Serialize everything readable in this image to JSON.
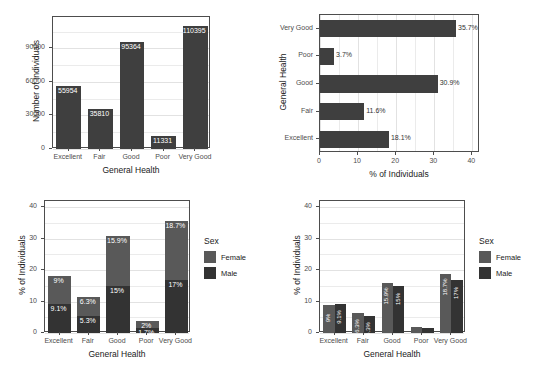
{
  "chart_data": [
    {
      "panel": "top-left",
      "type": "bar",
      "title": "",
      "xlabel": "General Health",
      "ylabel": "Number of Individuals",
      "categories": [
        "Excellent",
        "Fair",
        "Good",
        "Poor",
        "Very Good"
      ],
      "values": [
        55954,
        35810,
        95364,
        11331,
        110395
      ],
      "data_labels": [
        "55954",
        "35810",
        "95364",
        "11331",
        "110395"
      ],
      "yticks": [
        0,
        30000,
        60000,
        90000
      ],
      "ytick_labels": [
        "0",
        "30000",
        "60000",
        "90000"
      ],
      "ylim": [
        0,
        118000
      ],
      "grid": true,
      "legend": "none",
      "bar_color": "#3f3f3f"
    },
    {
      "panel": "top-right",
      "type": "bar",
      "orientation": "horizontal",
      "title": "",
      "xlabel": "% of Individuals",
      "ylabel": "General Health",
      "categories": [
        "Very Good",
        "Poor",
        "Good",
        "Fair",
        "Excellent"
      ],
      "values": [
        35.7,
        3.7,
        30.9,
        11.6,
        18.1
      ],
      "data_labels": [
        "35.7%",
        "3.7%",
        "30.9%",
        "11.6%",
        "18.1%"
      ],
      "xticks": [
        0,
        10,
        20,
        30,
        40
      ],
      "xtick_labels": [
        "0",
        "10",
        "20",
        "30",
        "40"
      ],
      "xlim": [
        0,
        42
      ],
      "grid": true,
      "legend": "none",
      "bar_color": "#3f3f3f"
    },
    {
      "panel": "bottom-left",
      "type": "bar",
      "stacked": true,
      "title": "",
      "xlabel": "General Health",
      "ylabel": "% of Individuals",
      "categories": [
        "Excellent",
        "Fair",
        "Good",
        "Poor",
        "Very Good"
      ],
      "series": [
        {
          "name": "Female",
          "color": "#595959",
          "values": [
            9.0,
            6.3,
            15.9,
            2.0,
            18.7
          ],
          "data_labels": [
            "9%",
            "6.3%",
            "15.9%",
            "2%",
            "18.7%"
          ]
        },
        {
          "name": "Male",
          "color": "#333333",
          "values": [
            9.1,
            5.3,
            15.0,
            1.7,
            17.0
          ],
          "data_labels": [
            "9.1%",
            "5.3%",
            "15%",
            "1.7%",
            "17%"
          ]
        }
      ],
      "yticks": [
        0,
        10,
        20,
        30,
        40
      ],
      "ytick_labels": [
        "0",
        "10",
        "20",
        "30",
        "40"
      ],
      "ylim": [
        0,
        42
      ],
      "grid": true,
      "legend": {
        "title": "Sex",
        "position": "right",
        "entries": [
          "Female",
          "Male"
        ]
      }
    },
    {
      "panel": "bottom-right",
      "type": "bar",
      "grouped": true,
      "title": "",
      "xlabel": "General Health",
      "ylabel": "% of Individuals",
      "categories": [
        "Excellent",
        "Fair",
        "Good",
        "Poor",
        "Very Good"
      ],
      "series": [
        {
          "name": "Female",
          "color": "#595959",
          "values": [
            9.0,
            6.3,
            15.9,
            2.0,
            18.7
          ],
          "data_labels": [
            "9%",
            "6.3%",
            "15.9%",
            "2%",
            "18.7%"
          ]
        },
        {
          "name": "Male",
          "color": "#333333",
          "values": [
            9.1,
            5.3,
            15.0,
            1.7,
            17.0
          ],
          "data_labels": [
            "9.1%",
            "5.3%",
            "15%",
            "1.7%",
            "17%"
          ]
        }
      ],
      "yticks": [
        0,
        10,
        20,
        30,
        40
      ],
      "ytick_labels": [
        "0",
        "10",
        "20",
        "30",
        "40"
      ],
      "ylim": [
        0,
        42
      ],
      "grid": true,
      "legend": {
        "title": "Sex",
        "position": "right",
        "entries": [
          "Female",
          "Male"
        ]
      }
    }
  ]
}
